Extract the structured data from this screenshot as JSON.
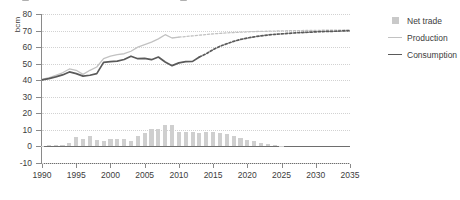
{
  "chart_data": {
    "type": "bar",
    "title": "",
    "xlabel": "",
    "ylabel": "bcm",
    "ylim": [
      -10,
      80
    ],
    "ytick_step": 10,
    "yticks": [
      -10,
      0,
      10,
      20,
      30,
      40,
      50,
      60,
      70,
      80
    ],
    "xlim": [
      1990,
      2035
    ],
    "xticks": [
      1990,
      1995,
      2000,
      2005,
      2010,
      2015,
      2020,
      2025,
      2030,
      2035
    ],
    "grid": true,
    "legend_position": "right",
    "x": [
      1990,
      1991,
      1992,
      1993,
      1994,
      1995,
      1996,
      1997,
      1998,
      1999,
      2000,
      2001,
      2002,
      2003,
      2004,
      2005,
      2006,
      2007,
      2008,
      2009,
      2010,
      2011,
      2012,
      2013,
      2014,
      2015,
      2016,
      2017,
      2018,
      2019,
      2020,
      2021,
      2022,
      2023,
      2024,
      2025,
      2026,
      2027,
      2028,
      2029,
      2030,
      2031,
      2032,
      2033,
      2034,
      2035
    ],
    "series": [
      {
        "name": "Net trade",
        "type": "bar",
        "color": "#cfcfcf",
        "values": [
          0.3,
          0.6,
          0.8,
          1.0,
          1.8,
          6.0,
          4.6,
          6.2,
          4.0,
          3.5,
          4.4,
          4.6,
          4.3,
          3.4,
          6.2,
          8.2,
          10.6,
          10.8,
          12.8,
          13.0,
          9.0,
          8.6,
          8.6,
          8.4,
          8.6,
          8.5,
          8.3,
          7.6,
          6.4,
          5.0,
          4.2,
          3.3,
          2.2,
          1.5,
          0.7,
          0.3,
          0.1,
          0.1,
          0.0,
          0.0,
          0.0,
          0.0,
          0.0,
          0.0,
          0.0,
          0.0
        ]
      },
      {
        "name": "Production",
        "type": "line",
        "color": "#c2c2c2",
        "style_history": "solid",
        "style_forecast": "dashed",
        "forecast_from": 2010,
        "values": [
          40.5,
          41.5,
          43.0,
          44.5,
          46.8,
          46.0,
          43.5,
          46.0,
          48.0,
          53.0,
          54.5,
          55.5,
          56.0,
          57.5,
          60.0,
          61.5,
          63.0,
          65.0,
          67.5,
          65.5,
          66.0,
          66.4,
          66.8,
          67.2,
          67.6,
          68.0,
          68.3,
          68.6,
          68.8,
          69.0,
          69.2,
          69.4,
          69.5,
          69.6,
          69.7,
          69.8,
          69.9,
          70.0,
          70.0,
          70.1,
          70.1,
          70.2,
          70.2,
          70.3,
          70.3,
          70.4
        ]
      },
      {
        "name": "Consumption",
        "type": "line",
        "color": "#5a5a5a",
        "style_history": "solid",
        "style_forecast": "dashed",
        "forecast_from": 2013,
        "values": [
          40.2,
          41.0,
          42.0,
          43.2,
          45.0,
          44.0,
          42.5,
          43.0,
          44.0,
          50.8,
          51.2,
          51.5,
          52.5,
          54.5,
          53.0,
          53.2,
          52.4,
          54.0,
          51.0,
          48.8,
          50.5,
          51.2,
          51.4,
          54.0,
          56.0,
          58.5,
          60.5,
          62.0,
          63.5,
          64.6,
          65.5,
          66.2,
          66.8,
          67.3,
          67.7,
          68.0,
          68.3,
          68.6,
          68.8,
          69.0,
          69.2,
          69.4,
          69.5,
          69.6,
          69.8,
          69.9
        ]
      }
    ]
  },
  "legend": {
    "items": [
      {
        "label": "Net trade",
        "marker": "square-swatch"
      },
      {
        "label": "Production",
        "marker": "line-swatch"
      },
      {
        "label": "Consumption",
        "marker": "line-swatch"
      }
    ]
  }
}
